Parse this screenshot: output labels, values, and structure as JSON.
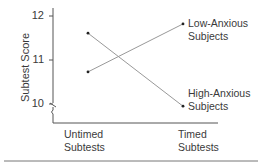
{
  "chart_data": {
    "type": "line",
    "title": "",
    "xlabel": "",
    "ylabel": "Subtest Score",
    "categories": [
      "Untimed Subtests",
      "Timed Subtests"
    ],
    "category_lines": [
      [
        "Untimed",
        "Subtests"
      ],
      [
        "Timed",
        "Subtests"
      ]
    ],
    "yticks": [
      "10",
      "11",
      "12"
    ],
    "ylim": [
      10,
      12
    ],
    "axis_break": true,
    "grid": false,
    "series": [
      {
        "name": "Low-Anxious Subjects",
        "label_lines": [
          "Low-Anxious",
          "Subjects"
        ],
        "values": [
          10.73,
          11.82
        ]
      },
      {
        "name": "High-Anxious Subjects",
        "label_lines": [
          "High-Anxious",
          "Subjects"
        ],
        "values": [
          11.61,
          9.95
        ]
      }
    ],
    "legend_position": "inline at line ends"
  }
}
